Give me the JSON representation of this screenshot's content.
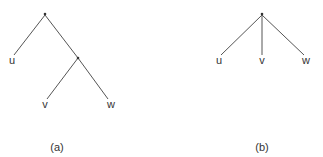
{
  "colors": {
    "edge": "#555555",
    "text": "#333333",
    "background": "#ffffff"
  },
  "trees": [
    {
      "caption": "(a)",
      "internal_nodes": [
        {
          "id": "root",
          "symbol": "*",
          "x": 45,
          "y": 15
        },
        {
          "id": "inner",
          "symbol": "*",
          "x": 78,
          "y": 58
        }
      ],
      "leaves": [
        {
          "id": "u",
          "label": "u",
          "x": 12,
          "y": 60
        },
        {
          "id": "v",
          "label": "v",
          "x": 45,
          "y": 104
        },
        {
          "id": "w",
          "label": "w",
          "x": 111,
          "y": 104
        }
      ],
      "edges": [
        [
          "root",
          "u"
        ],
        [
          "root",
          "inner"
        ],
        [
          "inner",
          "v"
        ],
        [
          "inner",
          "w"
        ]
      ]
    },
    {
      "caption": "(b)",
      "internal_nodes": [
        {
          "id": "root",
          "symbol": "*",
          "x": 262,
          "y": 15
        }
      ],
      "leaves": [
        {
          "id": "u",
          "label": "u",
          "x": 219,
          "y": 60
        },
        {
          "id": "v",
          "label": "v",
          "x": 262,
          "y": 60
        },
        {
          "id": "w",
          "label": "w",
          "x": 306,
          "y": 60
        }
      ],
      "edges": [
        [
          "root",
          "u"
        ],
        [
          "root",
          "v"
        ],
        [
          "root",
          "w"
        ]
      ]
    }
  ],
  "captions": {
    "a": "(a)",
    "b": "(b)"
  },
  "labels": {
    "a_u": "u",
    "a_v": "v",
    "a_w": "w",
    "b_u": "u",
    "b_v": "v",
    "b_w": "w"
  }
}
